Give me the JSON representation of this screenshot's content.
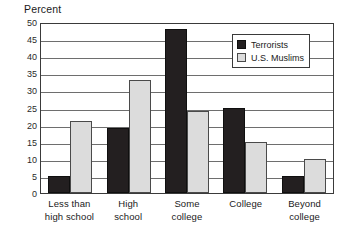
{
  "chart_data": {
    "type": "bar",
    "title": "",
    "xlabel": "",
    "ylabel": "Percent",
    "ylim": [
      0,
      50
    ],
    "ytick_step": 5,
    "yticks": [
      "50",
      "45",
      "40",
      "35",
      "30",
      "25",
      "20",
      "15",
      "10",
      "5",
      "0"
    ],
    "grid": true,
    "legend_position": "upper-right",
    "categories": [
      "Less than high school",
      "High school",
      "Some college",
      "College",
      "Beyond college"
    ],
    "category_lines": [
      [
        "Less than",
        "high school"
      ],
      [
        "High",
        "school"
      ],
      [
        "Some",
        "college"
      ],
      [
        "College",
        ""
      ],
      [
        "Beyond",
        "college"
      ]
    ],
    "series": [
      {
        "name": "Terrorists",
        "color": "#231f20",
        "values": [
          5,
          19,
          48,
          25,
          5
        ]
      },
      {
        "name": "U.S. Muslims",
        "color": "#dcdcdc",
        "values": [
          21,
          33,
          24,
          15,
          10
        ]
      }
    ]
  },
  "legend": {
    "items": [
      {
        "label": "Terrorists",
        "swatch": "dark"
      },
      {
        "label": "U.S. Muslims",
        "swatch": "light"
      }
    ]
  },
  "colors": {
    "terrorists": "#231f20",
    "us_muslims": "#dcdcdc",
    "axis": "#3a3a3a",
    "gridline": "#6e6e6e",
    "background": "#ffffff"
  }
}
